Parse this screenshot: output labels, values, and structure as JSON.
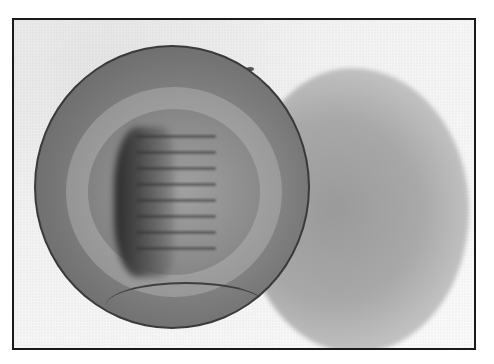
{
  "image": {
    "description": "Grayscale halftone illustration of a spherical embryo with a dark dorsal groove and segment-like bands, casting a diffuse shadow to the right, enclosed in a black rectangular frame",
    "subjects": [
      "embryo-sphere",
      "shadow",
      "frame"
    ],
    "colors": {
      "frame_border": "#1a1a1a",
      "background": "#f4f4f4",
      "sphere_mid": "#8a8a8a",
      "groove_dark": "#2b2b2b",
      "shadow": "#a8a8a8"
    },
    "segment_count": 8
  }
}
